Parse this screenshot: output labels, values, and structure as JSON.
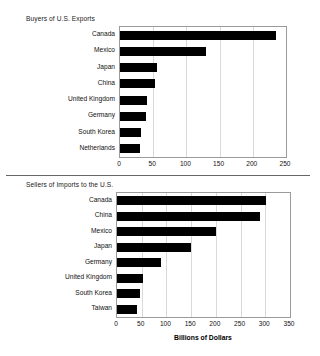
{
  "figure": {
    "background": "#ffffff",
    "bar_color": "#000000",
    "axis_color": "#9a9a9a",
    "grid_color": "#d9d9d9"
  },
  "chart_data": [
    {
      "type": "bar",
      "orientation": "horizontal",
      "title": "Buyers of U.S. Exports",
      "xlabel": "",
      "ylabel": "",
      "xlim": [
        0,
        250
      ],
      "ticks": [
        0,
        50,
        100,
        150,
        200,
        250
      ],
      "grid": true,
      "legend": "none",
      "categories": [
        "Canada",
        "Mexico",
        "Japan",
        "China",
        "United Kingdom",
        "Germany",
        "South Korea",
        "Netherlands"
      ],
      "values": [
        235,
        129,
        55,
        53,
        41,
        39,
        31,
        30
      ],
      "units": "Billions of Dollars"
    },
    {
      "type": "bar",
      "orientation": "horizontal",
      "title": "Sellers of Imports to the U.S.",
      "xlabel": "Billions of Dollars",
      "ylabel": "",
      "xlim": [
        0,
        350
      ],
      "ticks": [
        0,
        50,
        100,
        150,
        200,
        250,
        300,
        350
      ],
      "grid": true,
      "legend": "none",
      "categories": [
        "Canada",
        "China",
        "Mexico",
        "Japan",
        "Germany",
        "United Kingdom",
        "South Korea",
        "Taiwan"
      ],
      "values": [
        302,
        290,
        201,
        149,
        90,
        53,
        47,
        40
      ],
      "units": "Billions of Dollars"
    }
  ]
}
